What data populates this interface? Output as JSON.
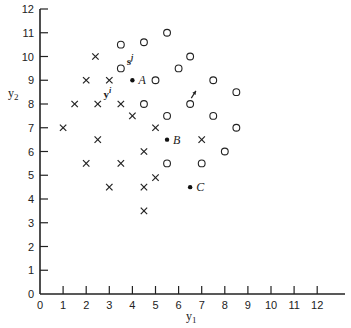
{
  "chart_data": {
    "type": "scatter",
    "title": "",
    "xlabel": "y1",
    "ylabel": "y2",
    "xlim": [
      0,
      13
    ],
    "ylim": [
      0,
      12
    ],
    "grid": false,
    "legend": null,
    "x_ticks": [
      0,
      1,
      2,
      3,
      4,
      5,
      6,
      7,
      8,
      9,
      10,
      11,
      12
    ],
    "y_ticks": [
      0,
      1,
      2,
      3,
      4,
      5,
      6,
      7,
      8,
      9,
      10,
      11,
      12
    ],
    "series": [
      {
        "name": "cross",
        "marker": "x",
        "points": [
          [
            2.4,
            10
          ],
          [
            2,
            9
          ],
          [
            3,
            9
          ],
          [
            1.5,
            8
          ],
          [
            2.5,
            8
          ],
          [
            3.5,
            8
          ],
          [
            4,
            7.5
          ],
          [
            1,
            7
          ],
          [
            5,
            7
          ],
          [
            2.5,
            6.5
          ],
          [
            7,
            6.5
          ],
          [
            4.5,
            6
          ],
          [
            2,
            5.5
          ],
          [
            3.5,
            5.5
          ],
          [
            5,
            4.9
          ],
          [
            3,
            4.5
          ],
          [
            4.5,
            4.5
          ],
          [
            4.5,
            3.5
          ]
        ]
      },
      {
        "name": "circle",
        "marker": "o",
        "points": [
          [
            3.5,
            10.5
          ],
          [
            4.5,
            10.6
          ],
          [
            5.5,
            11
          ],
          [
            3.5,
            9.5
          ],
          [
            6.5,
            10
          ],
          [
            6,
            9.5
          ],
          [
            5,
            9
          ],
          [
            7.5,
            9
          ],
          [
            8.5,
            8.5
          ],
          [
            4.5,
            8
          ],
          [
            6.5,
            8
          ],
          [
            5.5,
            7.5
          ],
          [
            7.5,
            7.5
          ],
          [
            8.5,
            7
          ],
          [
            8,
            6
          ],
          [
            5.5,
            5.5
          ],
          [
            7,
            5.5
          ]
        ]
      },
      {
        "name": "labeled",
        "marker": "dot",
        "points": [
          {
            "x": 4,
            "y": 9,
            "label": "A"
          },
          {
            "x": 5.5,
            "y": 6.5,
            "label": "B"
          },
          {
            "x": 6.5,
            "y": 4.5,
            "label": "C"
          }
        ]
      }
    ],
    "annotations": [
      {
        "text": "s",
        "sup": "j",
        "x": 3.75,
        "y": 9.65,
        "bold": true
      },
      {
        "text": "y",
        "sup": "i",
        "x": 2.75,
        "y": 8.25,
        "bold": true
      },
      {
        "type": "arrow",
        "from": [
          6.55,
          8.25
        ],
        "to": [
          6.75,
          8.55
        ]
      }
    ]
  }
}
